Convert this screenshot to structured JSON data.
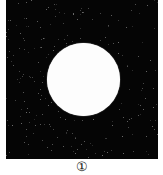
{
  "figure": {
    "panel_label": "①",
    "background_color": "#050505",
    "disk_color": "#fdfdfd",
    "disk": {
      "center_x": 77.5,
      "center_y": 79.5,
      "radius": 36.5
    }
  }
}
